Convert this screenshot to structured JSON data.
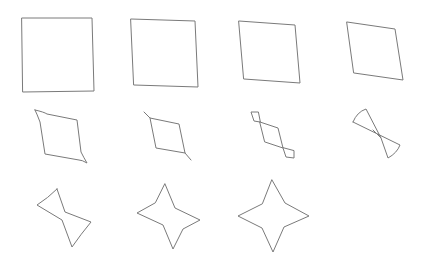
{
  "figure": {
    "stroke_color": "#7a7a7a",
    "background": "#ffffff",
    "rows": 3,
    "columns": 4,
    "shapes": [
      {
        "index": 1,
        "label": "square",
        "path": "M22,18 L92,18 L94,91 L23,92 Z"
      },
      {
        "index": 2,
        "label": "slightly-rotated-square",
        "path": "M131,19 L195,21 L198,87 L134,85 Z"
      },
      {
        "index": 3,
        "label": "sheared-quad",
        "path": "M239,21 L295,25 L300,83 L244,79 Z"
      },
      {
        "index": 4,
        "label": "rhombus",
        "path": "M347,22 L395,29 L403,80 L354,73 Z"
      },
      {
        "index": 5,
        "label": "rhombus-with-curved-tips",
        "path": "M35,110 Q44,112 47,114 L77,120 L81,152 Q84,158 87,163 Q82,160 79,160 L45,154 L40,122 Q37,114 35,110 Z"
      },
      {
        "index": 6,
        "label": "rhombus-with-tails",
        "path": "M144,112 L150,118 L179,124 L185,153 L191,160 M185,153 L156,148 L150,118"
      },
      {
        "index": 7,
        "label": "rhombus-with-end-loops",
        "path": "M260,122 L278,128 L283,148 L265,142 Z M260,122 L254,121 L251,112 L258,112 Z M283,148 L286,157 L294,158 L294,151 Z"
      },
      {
        "index": 8,
        "label": "bowtie-fans",
        "path": "M353,122 Q357,112 366,109 L381,138 L388,158 Q397,153 400,145 L353,122 M373,130 L381,138 L377,134"
      },
      {
        "index": 9,
        "label": "twisted-star",
        "path": "M57,189 L65,212 L91,222 Q81,234 72,247 L62,220 L37,205 Q48,198 57,189 Z"
      },
      {
        "index": 10,
        "label": "skewed-star",
        "path": "M165,184 L175,208 L200,220 L183,229 L173,249 L163,225 L137,213 L155,203 Z"
      },
      {
        "index": 11,
        "label": "four-pointed-star",
        "path": "M272,180 L285,203 L309,216 L284,227 L273,252 L262,228 L238,216 L262,204 Z"
      }
    ]
  }
}
